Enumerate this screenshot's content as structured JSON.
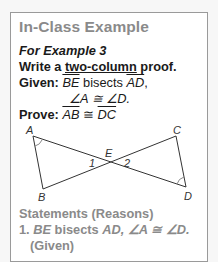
{
  "card": {
    "title": "In-Class Example",
    "example_label": "For Example 3",
    "instruction_prefix": "Write a ",
    "instruction_underlined": "two-column",
    "instruction_suffix": " proof.",
    "given_label": "Given:",
    "given_seg1": "BE",
    "given_mid": " bisects ",
    "given_seg2": "AD",
    "given_comma": ",",
    "given_angles": "∠A ≅ ∠D.",
    "prove_label": "Prove:",
    "prove_seg1": "AB",
    "prove_cong": " ≅ ",
    "prove_seg2": "DC"
  },
  "diagram": {
    "points": {
      "A": {
        "label": "A",
        "x": 32,
        "y": 135
      },
      "B": {
        "label": "B",
        "x": 42,
        "y": 188
      },
      "E": {
        "label": "E",
        "x": 108,
        "y": 160
      },
      "C": {
        "label": "C",
        "x": 175,
        "y": 135
      },
      "D": {
        "label": "D",
        "x": 185,
        "y": 186
      }
    },
    "angle1": "1",
    "angle2": "2"
  },
  "statements": {
    "header": "Statements (Reasons)",
    "items": [
      {
        "number": "1.",
        "seg1": "BE",
        "mid": " bisects ",
        "seg2": "AD",
        "rest": ", ∠A ≅ ∠D.",
        "reason": "(Given)"
      }
    ]
  }
}
